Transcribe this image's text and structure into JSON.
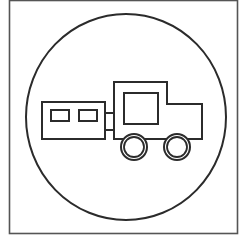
{
  "sign": {
    "description": "Circular sign with truck towing a trailer",
    "colors": {
      "background": "#ffffff",
      "stroke": "#2b2b2b",
      "frame": "#555555"
    },
    "frame": {
      "x": 9.5,
      "y": 0.5,
      "width": 228,
      "height": 233
    },
    "circle": {
      "cx": 126,
      "cy": 117,
      "rx": 100,
      "ry": 103
    },
    "trailer": {
      "body": {
        "x": 42,
        "y": 102,
        "width": 63,
        "height": 37
      },
      "windows": [
        {
          "x": 51,
          "y": 110,
          "width": 18,
          "height": 11
        },
        {
          "x": 79,
          "y": 110,
          "width": 18,
          "height": 11
        }
      ]
    },
    "hitch": {
      "x1": 105,
      "x2": 114,
      "y_top": 113,
      "y_bottom": 130
    },
    "truck": {
      "outline_points": "114,82 167,82 167,104 202,104 202,139 114,139",
      "window": {
        "x": 124,
        "y": 93,
        "width": 34,
        "height": 31
      }
    },
    "wheels": [
      {
        "cx": 134,
        "cy": 147,
        "r_outer": 13,
        "r_inner": 10
      },
      {
        "cx": 177,
        "cy": 147,
        "r_outer": 13,
        "r_inner": 10
      }
    ]
  }
}
